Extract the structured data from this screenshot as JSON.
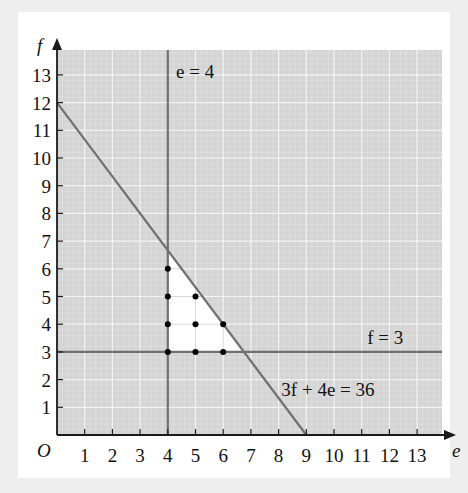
{
  "chart_data": {
    "type": "line",
    "title": "",
    "xlabel": "e",
    "ylabel": "f",
    "origin_label": "O",
    "xlim": [
      0,
      13.9
    ],
    "ylim": [
      0,
      13.9
    ],
    "x_ticks": [
      1,
      2,
      3,
      4,
      5,
      6,
      7,
      8,
      9,
      10,
      11,
      12,
      13
    ],
    "y_ticks": [
      1,
      2,
      3,
      4,
      5,
      6,
      7,
      8,
      9,
      10,
      11,
      12,
      13
    ],
    "grid": true,
    "minor_grid": true,
    "lines": [
      {
        "name": "e = 4",
        "type": "vertical",
        "x": 4
      },
      {
        "name": "f = 3",
        "type": "horizontal",
        "y": 3
      },
      {
        "name": "3f + 4e = 36",
        "type": "line",
        "points": [
          [
            0,
            12
          ],
          [
            9,
            0
          ]
        ]
      }
    ],
    "feasible_region": {
      "vertices": [
        [
          4,
          3
        ],
        [
          4,
          6.667
        ],
        [
          6.75,
          3
        ]
      ],
      "fill": "#ffffff"
    },
    "points": [
      [
        4,
        3
      ],
      [
        5,
        3
      ],
      [
        6,
        3
      ],
      [
        4,
        4
      ],
      [
        5,
        4
      ],
      [
        6,
        4
      ],
      [
        4,
        5
      ],
      [
        5,
        5
      ],
      [
        4,
        6
      ]
    ],
    "annotations": [
      {
        "text": "e = 4",
        "position": [
          4.3,
          12.9
        ]
      },
      {
        "text": "f = 3",
        "position": [
          11.2,
          3.3
        ]
      },
      {
        "text": "3f + 4e = 36",
        "position": [
          8.1,
          1.4
        ]
      }
    ]
  },
  "labels": {
    "x_axis": "e",
    "y_axis": "f",
    "origin": "O",
    "line_e": "e = 4",
    "line_f": "f = 3",
    "line_c": "3f + 4e = 36"
  },
  "colors": {
    "grid_bg": "#d4d4d4",
    "minor_grid": "#e2e2e2",
    "major_grid": "#f2f2f2",
    "line": "#707070",
    "axis": "#1a1a1a",
    "point": "#000000"
  }
}
